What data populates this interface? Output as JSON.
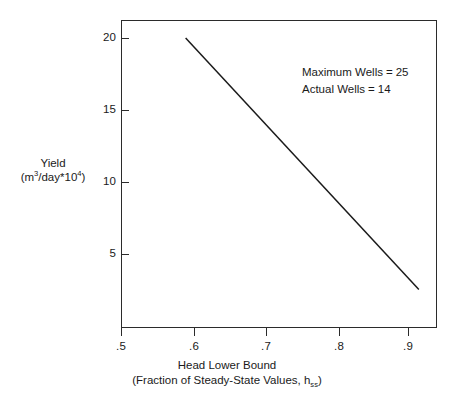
{
  "chart_data": {
    "type": "line",
    "title": "",
    "subtitle": "",
    "xlabel_line1": "Head Lower Bound",
    "xlabel_line2_prefix": "(Fraction of Steady-State Values, h",
    "xlabel_line2_sub": "ss",
    "xlabel_line2_suffix": ")",
    "ylabel_line1": "Yield",
    "ylabel_line2_prefix": "(m",
    "ylabel_line2_sup1": "3",
    "ylabel_line2_mid": "/day*10",
    "ylabel_line2_sup2": "4",
    "ylabel_line2_suffix": ")",
    "xlim": [
      0.5,
      0.935
    ],
    "ylim": [
      0.43,
      21.85
    ],
    "xticks": [
      0.5,
      0.6,
      0.7,
      0.8,
      0.9
    ],
    "xticklabels": [
      ".5",
      ".6",
      ".7",
      ".8",
      ".9"
    ],
    "yticks": [
      20,
      15,
      10,
      5
    ],
    "yticklabels": [
      "20",
      "15",
      "10",
      "5"
    ],
    "grid": false,
    "legend": "none",
    "series": [
      {
        "name": "yield-vs-head-lower-bound",
        "color": "#1a1a1a",
        "x": [
          0.589,
          0.91
        ],
        "y": [
          20.6,
          3.1
        ]
      }
    ],
    "annotations": [
      {
        "label": "Maximum Wells",
        "operator": "=",
        "value": "25"
      },
      {
        "label": "Actual Wells",
        "operator": "=",
        "value": "14"
      }
    ]
  }
}
